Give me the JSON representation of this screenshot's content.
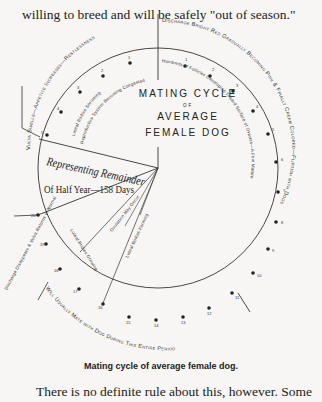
{
  "page": {
    "top_text_line": "willing to breed and will be safely \"out of season.\"",
    "caption": "Mating cycle of average female dog.",
    "bottom_text_line": "There is no definite rule about this, however. Some"
  },
  "diagram": {
    "title_line1": "MATING CYCLE",
    "title_line2": "OF",
    "title_line3": "AVERAGE",
    "title_line4": "FEMALE DOG",
    "remainder_line1": "Representing Remainder",
    "remainder_line2": "Of Half Year—158 Days",
    "outer_labels": {
      "before": "Vulva Swells—Appetite Increases—Restlessness",
      "discharge": "Discharge Bright Red Gradually Becoming Pink & Finally Cream Colored—Flirtish with Dogs",
      "mate": "Will Usually Mate with Dog During This Entire Period",
      "after": "Discharge Disappears & Vulva Returns to Normal"
    },
    "inner_labels": {
      "luteal_shrinking": "Luteal Bodies Shrinking",
      "reproductive": "Reproductive System Becoming Congested",
      "follicles": "Hundreds of Follicles Developing Toward Surface of Ovaries—A Few Mature and Swell Until They Burst",
      "luteal_growing": "Luteal Bodies Growing",
      "ovulation": "Ovulation May Occur",
      "luteal_bodies": "Luteal Bodies Forming"
    },
    "day_numbers": [
      "1",
      "2",
      "3",
      "4",
      "5",
      "6",
      "7",
      "8",
      "9",
      "10",
      "11",
      "12",
      "13",
      "14",
      "15",
      "16",
      "17",
      "18",
      "19",
      "20"
    ],
    "before_day_numbers": [
      "1",
      "2",
      "3",
      "4",
      "5"
    ]
  }
}
